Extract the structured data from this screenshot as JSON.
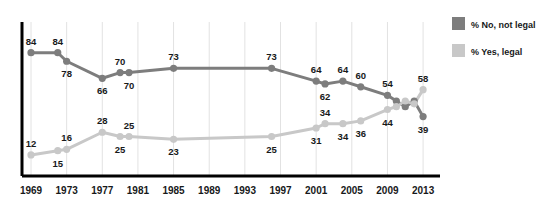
{
  "chart_data": {
    "type": "line",
    "title": "",
    "subtitle": "",
    "xlabel": "",
    "ylabel": "",
    "xlim": [
      1969,
      2014
    ],
    "ylim": [
      0,
      100
    ],
    "grid": "vertical-only",
    "legend_position": "right",
    "x_tick_labels": [
      "1969",
      "1973",
      "1977",
      "1981",
      "1985",
      "1989",
      "1993",
      "1997",
      "2001",
      "2005",
      "2009",
      "2013"
    ],
    "x_ticks": [
      1969,
      1973,
      1977,
      1981,
      1985,
      1989,
      1993,
      1997,
      2001,
      2005,
      2009,
      2013
    ],
    "series": [
      {
        "name": "% No, not legal",
        "color": "#7d7d7d",
        "x": [
          1969,
          1972,
          1973,
          1977,
          1979,
          1980,
          1985,
          1996,
          2001,
          2002,
          2004,
          2006,
          2009,
          2010,
          2011,
          2012,
          2013
        ],
        "values": [
          84,
          84,
          78,
          66,
          70,
          70,
          73,
          73,
          64,
          62,
          64,
          60,
          54,
          50,
          46,
          50,
          39
        ],
        "labels": [
          {
            "x": 1969,
            "v": 84,
            "text": "84",
            "pos": "above"
          },
          {
            "x": 1972,
            "v": 84,
            "text": "84",
            "pos": "above"
          },
          {
            "x": 1973,
            "v": 78,
            "text": "78",
            "pos": "below"
          },
          {
            "x": 1977,
            "v": 66,
            "text": "66",
            "pos": "below"
          },
          {
            "x": 1979,
            "v": 70,
            "text": "70",
            "pos": "above"
          },
          {
            "x": 1980,
            "v": 70,
            "text": "70",
            "pos": "below"
          },
          {
            "x": 1985,
            "v": 73,
            "text": "73",
            "pos": "above"
          },
          {
            "x": 1996,
            "v": 73,
            "text": "73",
            "pos": "above"
          },
          {
            "x": 2001,
            "v": 64,
            "text": "64",
            "pos": "above"
          },
          {
            "x": 2002,
            "v": 62,
            "text": "62",
            "pos": "below"
          },
          {
            "x": 2004,
            "v": 64,
            "text": "64",
            "pos": "above"
          },
          {
            "x": 2006,
            "v": 60,
            "text": "60",
            "pos": "above"
          },
          {
            "x": 2009,
            "v": 54,
            "text": "54",
            "pos": "above"
          },
          {
            "x": 2013,
            "v": 39,
            "text": "39",
            "pos": "below"
          }
        ]
      },
      {
        "name": "% Yes, legal",
        "color": "#c8c8c8",
        "x": [
          1969,
          1972,
          1973,
          1977,
          1979,
          1980,
          1985,
          1996,
          2001,
          2002,
          2004,
          2006,
          2009,
          2010,
          2011,
          2012,
          2013
        ],
        "values": [
          12,
          15,
          16,
          28,
          25,
          25,
          23,
          25,
          31,
          34,
          34,
          36,
          44,
          46,
          50,
          48,
          58
        ],
        "labels": [
          {
            "x": 1969,
            "v": 12,
            "text": "12",
            "pos": "above"
          },
          {
            "x": 1972,
            "v": 15,
            "text": "15",
            "pos": "below"
          },
          {
            "x": 1973,
            "v": 16,
            "text": "16",
            "pos": "above"
          },
          {
            "x": 1977,
            "v": 28,
            "text": "28",
            "pos": "above"
          },
          {
            "x": 1979,
            "v": 25,
            "text": "25",
            "pos": "below"
          },
          {
            "x": 1980,
            "v": 25,
            "text": "25",
            "pos": "above"
          },
          {
            "x": 1985,
            "v": 23,
            "text": "23",
            "pos": "below"
          },
          {
            "x": 1996,
            "v": 25,
            "text": "25",
            "pos": "below"
          },
          {
            "x": 2001,
            "v": 31,
            "text": "31",
            "pos": "below"
          },
          {
            "x": 2002,
            "v": 34,
            "text": "34",
            "pos": "above"
          },
          {
            "x": 2004,
            "v": 34,
            "text": "34",
            "pos": "below"
          },
          {
            "x": 2006,
            "v": 36,
            "text": "36",
            "pos": "below"
          },
          {
            "x": 2009,
            "v": 44,
            "text": "44",
            "pos": "below"
          },
          {
            "x": 2013,
            "v": 58,
            "text": "58",
            "pos": "above"
          }
        ]
      }
    ]
  },
  "legend": {
    "items": [
      {
        "label": "% No, not legal",
        "color": "#7d7d7d"
      },
      {
        "label": "% Yes, legal",
        "color": "#c8c8c8"
      }
    ]
  },
  "colors": {
    "no_legal": "#7d7d7d",
    "yes_legal": "#c8c8c8",
    "axis": "#000000",
    "gridline": "#e2e2e2",
    "text": "#17191a",
    "background": "#ffffff"
  }
}
